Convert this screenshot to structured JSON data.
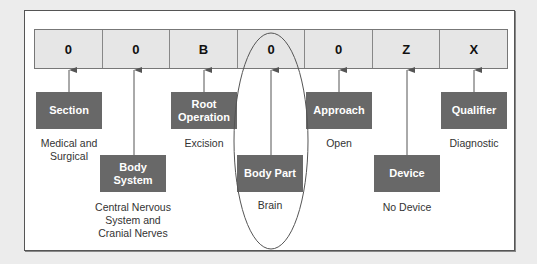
{
  "diagram": {
    "code_characters": [
      "0",
      "0",
      "B",
      "0",
      "0",
      "Z",
      "X"
    ],
    "fields": [
      {
        "label": "Section",
        "value": "Medical and Surgical"
      },
      {
        "label": "Body System",
        "value": "Central Nervous System and Cranial Nerves"
      },
      {
        "label": "Root Operation",
        "value": "Excision"
      },
      {
        "label": "Body Part",
        "value": "Brain"
      },
      {
        "label": "Approach",
        "value": "Open"
      },
      {
        "label": "Device",
        "value": "No Device"
      },
      {
        "label": "Qualifier",
        "value": "Diagnostic"
      }
    ],
    "highlighted_field": "Body Part",
    "colors": {
      "label_box": "#686868",
      "code_cell": "#e6e6e6",
      "connector": "#555555"
    }
  }
}
